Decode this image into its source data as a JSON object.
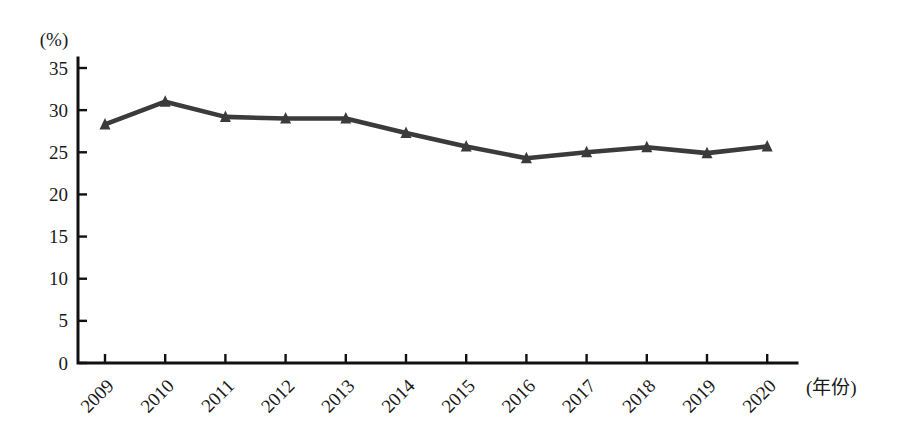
{
  "figure": {
    "y_unit_label": "(%)",
    "x_unit_label": "(年份)"
  },
  "chart_data": {
    "type": "line",
    "title": "",
    "categories": [
      "2009",
      "2010",
      "2011",
      "2012",
      "2013",
      "2014",
      "2015",
      "2016",
      "2017",
      "2018",
      "2019",
      "2020"
    ],
    "series": [
      {
        "name": "percentage-series",
        "values": [
          28.3,
          31.0,
          29.2,
          29.0,
          29.0,
          27.3,
          25.7,
          24.3,
          25.0,
          25.6,
          24.9,
          25.7
        ]
      }
    ],
    "xlabel": "(年份)",
    "ylabel": "(%)",
    "ylim": [
      0,
      35
    ],
    "ytick_step": 5,
    "grid": false,
    "legend": "none",
    "marker": "triangle-up",
    "line_color": "#3b3b3b",
    "axis_color": "#111111"
  }
}
